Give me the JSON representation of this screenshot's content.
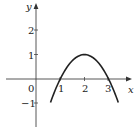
{
  "chart_data": {
    "type": "line",
    "title": "",
    "xlabel": "x",
    "ylabel": "y",
    "function": "y = -(x-2)^2 + 1",
    "x": [
      0.7,
      1.0,
      1.5,
      2.0,
      2.5,
      3.0,
      3.3
    ],
    "series": [
      {
        "name": "f(x)",
        "values": [
          -0.69,
          0.0,
          0.75,
          1.0,
          0.75,
          0.0,
          -0.69
        ]
      }
    ],
    "x_ticks": [
      "1",
      "2",
      "3"
    ],
    "y_ticks": [
      "2",
      "1",
      "-1"
    ],
    "origin_label": "0",
    "xlim": [
      -0.9,
      3.9
    ],
    "ylim": [
      -2.1,
      3.1
    ],
    "grid": false,
    "legend": "none",
    "annotations": [
      "vertex (2, 1)",
      "x-intercepts at 1 and 3"
    ]
  },
  "colors": {
    "curve": "#222222",
    "axes": "#444444",
    "background": "#ffffff"
  },
  "labels": {
    "x_axis": "x",
    "y_axis": "y",
    "origin": "0",
    "xt1": "1",
    "xt2": "2",
    "xt3": "3",
    "yt2": "2",
    "yt1": "1",
    "ytm1": "−1"
  }
}
